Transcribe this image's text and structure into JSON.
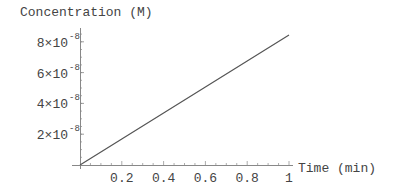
{
  "chart_data": {
    "type": "line",
    "title": "",
    "xlabel": "Time (min)",
    "ylabel": "Concentration (M)",
    "x": [
      0,
      0.2,
      0.4,
      0.6,
      0.8,
      1.0
    ],
    "series": [
      {
        "name": "Concentration",
        "values": [
          0,
          1.69e-08,
          3.38e-08,
          5.07e-08,
          6.76e-08,
          8.45e-08
        ]
      }
    ],
    "xlim": [
      0,
      1
    ],
    "ylim": [
      0,
      8.8e-08
    ],
    "x_ticks": [
      {
        "value": 0.2,
        "label": "0.2"
      },
      {
        "value": 0.4,
        "label": "0.4"
      },
      {
        "value": 0.6,
        "label": "0.6"
      },
      {
        "value": 0.8,
        "label": "0.8"
      },
      {
        "value": 1,
        "label": "1"
      }
    ],
    "y_ticks": [
      {
        "value": 2e-08,
        "mantissa": "2×10",
        "exponent": "-8"
      },
      {
        "value": 4e-08,
        "mantissa": "4×10",
        "exponent": "-8"
      },
      {
        "value": 6e-08,
        "mantissa": "6×10",
        "exponent": "-8"
      },
      {
        "value": 8e-08,
        "mantissa": "8×10",
        "exponent": "-8"
      }
    ],
    "grid": false,
    "legend": null,
    "colors": {
      "line": "#555555",
      "axis": "#888888",
      "text": "#444444"
    }
  }
}
